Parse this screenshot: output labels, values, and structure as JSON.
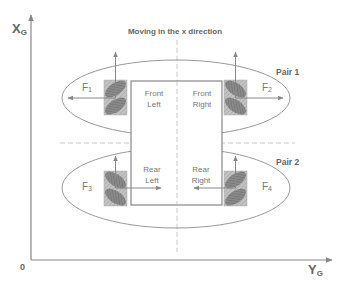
{
  "title": "Moving in the x direction",
  "axes": {
    "vertical": {
      "label": "X",
      "subscript": "G"
    },
    "horizontal": {
      "label": "Y",
      "subscript": "G"
    },
    "origin": "0"
  },
  "pairs": [
    {
      "label": "Pair 1"
    },
    {
      "label": "Pair 2"
    }
  ],
  "wheels": [
    {
      "line1": "Front",
      "line2": "Left",
      "force": "F",
      "force_sub": "1"
    },
    {
      "line1": "Front",
      "line2": "Right",
      "force": "F",
      "force_sub": "2"
    },
    {
      "line1": "Rear",
      "line2": "Left",
      "force": "F",
      "force_sub": "3"
    },
    {
      "line1": "Rear",
      "line2": "Right",
      "force": "F",
      "force_sub": "4"
    }
  ],
  "colors": {
    "line": "#888888",
    "ellipse": "#999999",
    "wheel_fill": "#b8b8b8",
    "roller": "#7a7a7a",
    "dash": "#bbbbbb"
  }
}
